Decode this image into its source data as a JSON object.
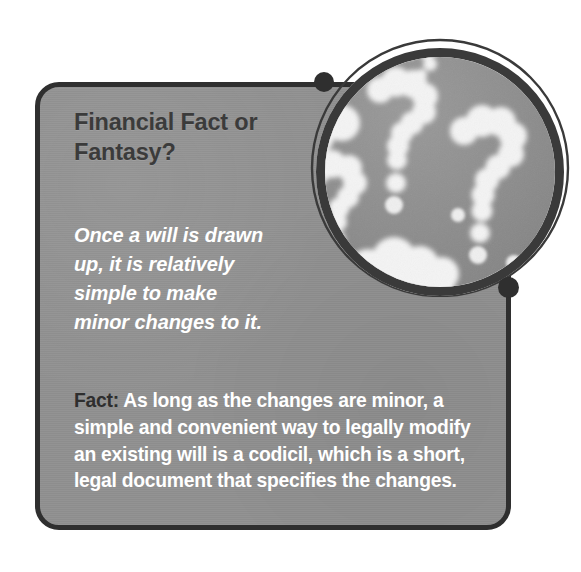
{
  "callout": {
    "headline": "Financial Fact or Fantasy?",
    "subhead": "Once a will is drawn up, it is relatively simple to make minor changes to it.",
    "body_lead": "Fact:",
    "body_text": " As long as the changes are minor, a simple and convenient way to legally modify an existing will is a codicil, which is a short, legal document that specifies the changes."
  },
  "badge": {
    "image_name": "question-mark-clouds-photo",
    "image_description": "Cloud shapes forming question marks against a gray sky",
    "outer_ring_icon": "thin-outline-ring",
    "dot_top_left_icon": "connector-dot-icon",
    "dot_bottom_right_icon": "connector-dot-icon"
  },
  "colors": {
    "panel_fill": "#919191",
    "panel_border": "#2f2f2f",
    "headline_text": "#3b3b3b",
    "body_text": "#ffffff",
    "lead_text": "#2e2e2e",
    "sky": "#8e8e8e",
    "cloud": "#f2f2f2",
    "page_background": "#ffffff"
  }
}
